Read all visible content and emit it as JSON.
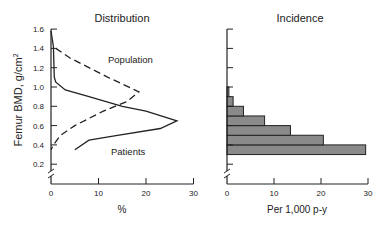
{
  "chart_data": [
    {
      "type": "line",
      "title": "Distribution",
      "xlabel": "%",
      "ylabel": "Femur BMD, g/cm²",
      "xlim": [
        0,
        30
      ],
      "ylim": [
        0,
        1.6
      ],
      "x_ticks": [
        "0",
        "10",
        "20",
        "30"
      ],
      "y_ticks": [
        "0.2",
        "0.4",
        "0.6",
        "0.8",
        "1.0",
        "1.2",
        "1.4",
        "1.6"
      ],
      "grid": false,
      "axis_break": true,
      "series": [
        {
          "name": "Population",
          "style": "dashed",
          "points": [
            [
              1,
              1.4
            ],
            [
              4,
              1.3
            ],
            [
              12,
              1.1
            ],
            [
              18.5,
              0.95
            ],
            [
              16,
              0.85
            ],
            [
              11,
              0.75
            ],
            [
              5,
              0.6
            ],
            [
              2,
              0.5
            ],
            [
              0.5,
              0.4
            ],
            [
              0,
              0.35
            ]
          ]
        },
        {
          "name": "Patients",
          "style": "solid",
          "points": [
            [
              0,
              1.58
            ],
            [
              0.5,
              1.42
            ],
            [
              0.7,
              1.1
            ],
            [
              1,
              1.05
            ],
            [
              3,
              0.97
            ],
            [
              8,
              0.9
            ],
            [
              15,
              0.8
            ],
            [
              20,
              0.75
            ],
            [
              26.5,
              0.65
            ],
            [
              23,
              0.57
            ],
            [
              14,
              0.5
            ],
            [
              8,
              0.45
            ],
            [
              5,
              0.35
            ]
          ]
        }
      ],
      "annotations": [
        "Population",
        "Patients"
      ]
    },
    {
      "type": "bar",
      "orientation": "horizontal",
      "title": "Incidence",
      "xlabel": "Per 1,000 p-y",
      "ylabel": "Femur BMD, g/cm²",
      "xlim": [
        0,
        30
      ],
      "ylim": [
        0,
        1.6
      ],
      "x_ticks": [
        "0",
        "10",
        "20",
        "30"
      ],
      "grid": false,
      "axis_break": true,
      "categories": [
        "0.3-0.4",
        "0.4-0.5",
        "0.5-0.6",
        "0.6-0.7",
        "0.7-0.8",
        "0.8-0.9",
        "0.9-1.0"
      ],
      "bins": [
        [
          0.3,
          0.4
        ],
        [
          0.4,
          0.5
        ],
        [
          0.5,
          0.6
        ],
        [
          0.6,
          0.7
        ],
        [
          0.7,
          0.8
        ],
        [
          0.8,
          0.9
        ],
        [
          0.9,
          1.0
        ]
      ],
      "values": [
        29.5,
        20.5,
        13.5,
        8,
        3.5,
        1.3,
        0.4
      ],
      "bar_color": "#8a8a8a"
    }
  ],
  "labels": {
    "left_title": "Distribution",
    "right_title": "Incidence",
    "y_axis_label": "Femur BMD, g/cm",
    "y_axis_sup": "2",
    "left_xlabel": "%",
    "right_xlabel": "Per 1,000 p-y",
    "population": "Population",
    "patients": "Patients",
    "y_ticks": [
      "1.6",
      "1.4",
      "1.2",
      "1.0",
      "0.8",
      "0.6",
      "0.4",
      "0.2"
    ],
    "x_ticks": [
      "0",
      "10",
      "20",
      "30"
    ]
  }
}
